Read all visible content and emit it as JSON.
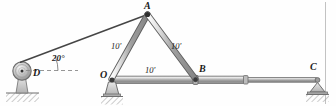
{
  "figure": {
    "type": "statics-free-body-diagram",
    "border_color": "#b8b8b8",
    "member_color": "#8d8d8d",
    "member_outline": "#5a5a5a",
    "cable_color": "#4a4a4a",
    "ground_color": "#c9c9c9"
  },
  "labels": {
    "point_a": "A",
    "point_b": "B",
    "point_c": "C",
    "point_d": "D",
    "point_o": "O",
    "angle_cable": "20°",
    "dim_left_member": "10'",
    "dim_right_member": "10'",
    "dim_bottom_member": "10'"
  },
  "geometry": {
    "A": [
      148,
      14
    ],
    "B": [
      196,
      80
    ],
    "C": [
      317,
      82
    ],
    "D": [
      22,
      71
    ],
    "O": [
      111,
      80
    ],
    "cable_angle_deg": 20,
    "member_length_ft": 10
  },
  "icons": {
    "pulley": "pulley-icon",
    "pin_support": "pin-support-icon",
    "roller_support": "roller-support-icon",
    "hatched_ground": "ground-hatch-icon"
  }
}
